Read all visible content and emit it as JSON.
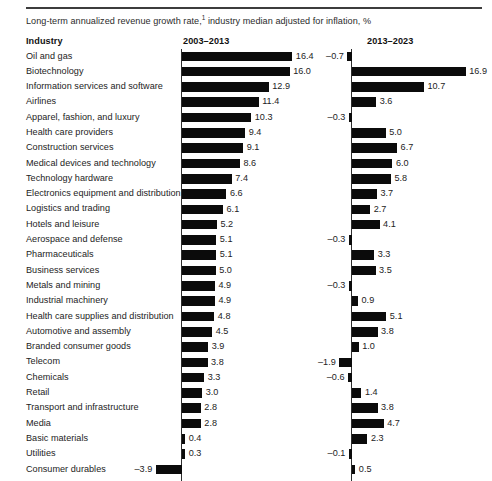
{
  "exhibit": {
    "subtitle_pre": "Long-term annualized revenue growth rate,",
    "subtitle_footnote_marker": "1",
    "subtitle_post": " industry median adjusted for inflation, %"
  },
  "headers": {
    "industry": "Industry",
    "period_1": "2003–2013",
    "period_2": "2013–2023"
  },
  "chart_data": {
    "type": "bar",
    "xlabel": "",
    "ylabel": "Industry",
    "orientation": "horizontal",
    "grid": false,
    "legend": "none",
    "axis_ranges": {
      "period_1": [
        -4.5,
        17.5
      ],
      "period_2": [
        -2.5,
        17.5
      ]
    },
    "categories": [
      "Oil and gas",
      "Biotechnology",
      "Information services and software",
      "Airlines",
      "Apparel, fashion, and luxury",
      "Health care providers",
      "Construction services",
      "Medical devices and technology",
      "Technology hardware",
      "Electronics equipment and distribution",
      "Logistics and trading",
      "Hotels and leisure",
      "Aerospace and defense",
      "Pharmaceuticals",
      "Business services",
      "Metals and mining",
      "Industrial machinery",
      "Health care supplies and distribution",
      "Automotive and assembly",
      "Branded consumer goods",
      "Telecom",
      "Chemicals",
      "Retail",
      "Transport and infrastructure",
      "Media",
      "Basic materials",
      "Utilities",
      "Consumer durables"
    ],
    "series": [
      {
        "name": "2003–2013",
        "values": [
          16.4,
          16.0,
          12.9,
          11.4,
          10.3,
          9.4,
          9.1,
          8.6,
          7.4,
          6.6,
          6.1,
          5.2,
          5.1,
          5.1,
          5.0,
          4.9,
          4.9,
          4.8,
          4.5,
          3.9,
          3.8,
          3.3,
          3.0,
          2.8,
          2.8,
          0.4,
          0.3,
          -3.9
        ],
        "labels": [
          "16.4",
          "16.0",
          "12.9",
          "11.4",
          "10.3",
          "9.4",
          "9.1",
          "8.6",
          "7.4",
          "6.6",
          "6.1",
          "5.2",
          "5.1",
          "5.1",
          "5.0",
          "4.9",
          "4.9",
          "4.8",
          "4.5",
          "3.9",
          "3.8",
          "3.3",
          "3.0",
          "2.8",
          "2.8",
          "0.4",
          "0.3",
          "–3.9"
        ]
      },
      {
        "name": "2013–2023",
        "values": [
          -0.7,
          16.9,
          10.7,
          3.6,
          -0.3,
          5.0,
          6.7,
          6.0,
          5.8,
          3.7,
          2.7,
          4.1,
          -0.3,
          3.3,
          3.5,
          -0.3,
          0.9,
          5.1,
          3.8,
          1.0,
          -1.9,
          -0.6,
          1.4,
          3.8,
          4.7,
          2.3,
          -0.1,
          0.5
        ],
        "labels": [
          "–0.7",
          "16.9",
          "10.7",
          "3.6",
          "–0.3",
          "5.0",
          "6.7",
          "6.0",
          "5.8",
          "3.7",
          "2.7",
          "4.1",
          "–0.3",
          "3.3",
          "3.5",
          "–0.3",
          "0.9",
          "5.1",
          "3.8",
          "1.0",
          "–1.9",
          "–0.6",
          "1.4",
          "3.8",
          "4.7",
          "2.3",
          "–0.1",
          "0.5"
        ]
      }
    ]
  },
  "style": {
    "bar_color": "#0b0b0b",
    "axis_color": "#2e2e2e",
    "rule_color": "#3c3c3c",
    "text_color": "#232323"
  }
}
